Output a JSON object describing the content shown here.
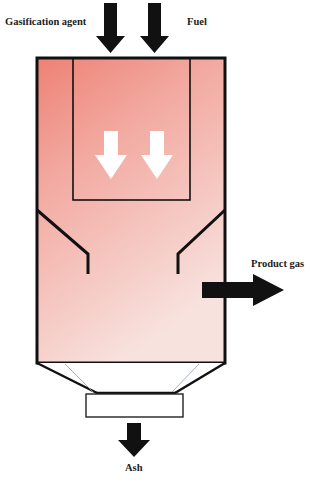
{
  "diagram": {
    "labels": {
      "gasification_agent": "Gasification agent",
      "fuel": "Fuel",
      "product_gas": "Product gas",
      "ash": "Ash"
    },
    "colors": {
      "fill_top": "#ee8478",
      "fill_bottom": "#f8e0dc",
      "stroke": "#111111",
      "arrow": "#111111",
      "inner_arrow": "#ffffff"
    }
  }
}
